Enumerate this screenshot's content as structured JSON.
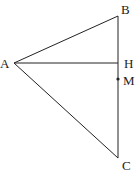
{
  "diagram": {
    "type": "geometry-triangle",
    "stroke_color": "#222222",
    "background": "#ffffff",
    "points": {
      "A": {
        "label": "A",
        "x": 14,
        "y": 63,
        "label_x": 0,
        "label_y": 68
      },
      "B": {
        "label": "B",
        "x": 118,
        "y": 16,
        "label_x": 121,
        "label_y": 14
      },
      "H": {
        "label": "H",
        "x": 118,
        "y": 63,
        "label_x": 124,
        "label_y": 68
      },
      "M": {
        "label": "M",
        "x": 118,
        "y": 79,
        "label_x": 123,
        "label_y": 85
      },
      "C": {
        "label": "C",
        "x": 118,
        "y": 158,
        "label_x": 122,
        "label_y": 170
      }
    },
    "segments": [
      {
        "from": "A",
        "to": "B"
      },
      {
        "from": "A",
        "to": "C"
      },
      {
        "from": "B",
        "to": "C"
      },
      {
        "from": "A",
        "to": "H"
      }
    ],
    "marked_points": [
      "M"
    ]
  }
}
